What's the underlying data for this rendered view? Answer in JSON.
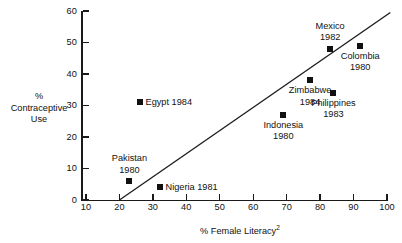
{
  "chart_data": {
    "type": "scatter",
    "title": "",
    "xlabel": "% Female Literacy",
    "xlabel_superscript": "2",
    "ylabel_lines": [
      "%",
      "Contraceptive",
      "Use"
    ],
    "xlim": [
      10,
      100
    ],
    "ylim": [
      0,
      60
    ],
    "xticks": [
      10,
      20,
      30,
      40,
      50,
      60,
      70,
      80,
      90,
      100
    ],
    "yticks": [
      0,
      10,
      20,
      30,
      40,
      50,
      60
    ],
    "grid": false,
    "legend": "none",
    "points": [
      {
        "label": "Pakistan",
        "year": "1980",
        "x": 23,
        "y": 6,
        "label_lines": [
          "Pakistan",
          "1980"
        ],
        "label_pos": "above"
      },
      {
        "label": "Nigeria",
        "year": "1981",
        "x": 32,
        "y": 4,
        "label_lines": [
          "Nigeria 1981"
        ],
        "label_pos": "right"
      },
      {
        "label": "Egypt",
        "year": "1984",
        "x": 26,
        "y": 31,
        "label_lines": [
          "Egypt 1984"
        ],
        "label_pos": "right"
      },
      {
        "label": "Indonesia",
        "year": "1980",
        "x": 69,
        "y": 27,
        "label_lines": [
          "Indonesia",
          "1980"
        ],
        "label_pos": "below"
      },
      {
        "label": "Zimbabwe",
        "year": "1984",
        "x": 77,
        "y": 38,
        "label_lines": [
          "Zimbabwe",
          "1984"
        ],
        "label_pos": "below"
      },
      {
        "label": "Philippines",
        "year": "1983",
        "x": 84,
        "y": 34,
        "label_lines": [
          "Philippines",
          "1983"
        ],
        "label_pos": "below"
      },
      {
        "label": "Mexico",
        "year": "1982",
        "x": 83,
        "y": 48,
        "label_lines": [
          "Mexico",
          "1982"
        ],
        "label_pos": "above"
      },
      {
        "label": "Colombia",
        "year": "1980",
        "x": 92,
        "y": 49,
        "label_lines": [
          "Colombia",
          "1980"
        ],
        "label_pos": "below"
      }
    ],
    "trend_line": {
      "x1": 20,
      "y1": 0,
      "x2": 101,
      "y2": 59.5
    }
  }
}
